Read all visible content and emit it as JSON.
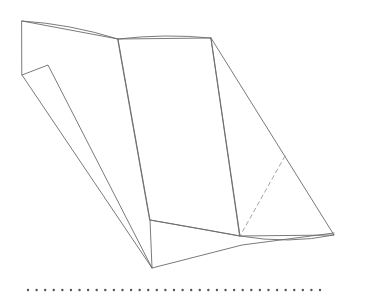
{
  "figure": {
    "canvas": {
      "width": 367,
      "height": 296
    },
    "colors": {
      "background": "#ffffff",
      "stroke": "#6b6b6b",
      "stroke_light": "#8a8a8a",
      "dashed_stroke": "#9a9a9a",
      "dotted_marker": "#555555",
      "fill": "#ffffff"
    },
    "stroke_width": 0.9,
    "parts": [
      {
        "name": "top-curved-edge",
        "kind": "curve",
        "points": [
          [
            22,
            21
          ],
          [
            70,
            27
          ],
          [
            118,
            39
          ]
        ],
        "style": "solid"
      },
      {
        "name": "top-right-edge",
        "kind": "curve",
        "points": [
          [
            118,
            39
          ],
          [
            165,
            36
          ],
          [
            211,
            38
          ]
        ],
        "style": "solid"
      },
      {
        "name": "main-panel",
        "kind": "polygon",
        "points": [
          [
            118,
            39
          ],
          [
            211,
            38
          ],
          [
            240,
            236
          ],
          [
            150,
            220
          ]
        ],
        "style": "solid"
      },
      {
        "name": "right-panel",
        "kind": "polygon",
        "points": [
          [
            211,
            38
          ],
          [
            334,
            235
          ],
          [
            240,
            236
          ]
        ],
        "style": "solid"
      },
      {
        "name": "hidden-fold-dashed",
        "kind": "line",
        "points": [
          [
            285,
            156
          ],
          [
            240,
            236
          ]
        ],
        "style": "dashed"
      },
      {
        "name": "left-band-panel",
        "kind": "polygon",
        "points": [
          [
            22,
            21
          ],
          [
            118,
            39
          ],
          [
            150,
            220
          ],
          [
            152,
            268
          ],
          [
            22,
            75
          ]
        ],
        "style": "solid"
      },
      {
        "name": "left-flap",
        "kind": "polyline",
        "points": [
          [
            22,
            75
          ],
          [
            48,
            65
          ],
          [
            152,
            268
          ]
        ],
        "style": "solid"
      },
      {
        "name": "bottom-tail",
        "kind": "polyline",
        "points": [
          [
            152,
            268
          ],
          [
            242,
            245
          ],
          [
            334,
            233
          ]
        ],
        "style": "solid"
      },
      {
        "name": "bottom-inner-edge",
        "kind": "curve",
        "points": [
          [
            240,
            236
          ],
          [
            288,
            240
          ],
          [
            334,
            235
          ]
        ],
        "style": "solid"
      },
      {
        "name": "bottom-left-fold",
        "kind": "curve",
        "points": [
          [
            150,
            220
          ],
          [
            196,
            228
          ],
          [
            240,
            236
          ]
        ],
        "style": "solid"
      }
    ],
    "dotted_baseline": {
      "name": "dotted-baseline",
      "y": 290,
      "x_start": 28,
      "x_end": 320,
      "dot_count": 35,
      "dot_radius": 1.2,
      "spacing": 8.6
    }
  }
}
